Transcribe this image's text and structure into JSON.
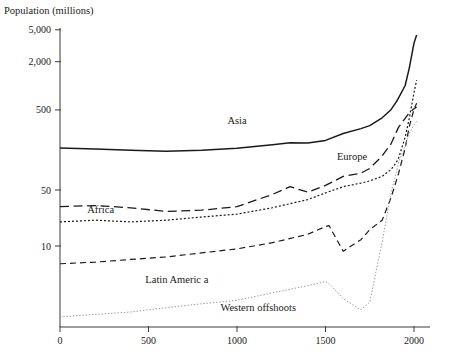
{
  "chart_data": {
    "type": "line",
    "title": "Population (millions)",
    "xlabel": "",
    "ylabel": "Population (millions)",
    "yscale": "log",
    "xlim": [
      0,
      2030
    ],
    "ylim": [
      1,
      7000
    ],
    "grid": false,
    "legend_position": "inline-labels",
    "xticks": [
      0,
      500,
      1000,
      1500,
      2000
    ],
    "xtick_labels": [
      "0",
      "500",
      "1000",
      "1500",
      "2000"
    ],
    "yticks": [
      10,
      50,
      500,
      2000,
      5000
    ],
    "ytick_labels": [
      "10",
      "50",
      "500",
      "2,000",
      "5,000"
    ],
    "series": [
      {
        "name": "Asia",
        "label": "Asia",
        "style": "solid",
        "label_x": 1000,
        "label_y": 330,
        "x": [
          0,
          200,
          400,
          600,
          800,
          1000,
          1200,
          1300,
          1400,
          1500,
          1600,
          1700,
          1750,
          1820,
          1870,
          1900,
          1913,
          1950,
          1973,
          2000,
          2015
        ],
        "y": [
          167,
          163,
          157,
          152,
          157,
          166,
          184,
          194,
          193,
          208,
          254,
          292,
          318,
          399,
          503,
          629,
          708,
          1008,
          1651,
          3410,
          4300
        ]
      },
      {
        "name": "Europe",
        "label": "Europe",
        "style": "long-dash",
        "label_x": 1650,
        "label_y": 120,
        "x": [
          0,
          200,
          400,
          600,
          800,
          1000,
          1200,
          1300,
          1400,
          1500,
          1600,
          1700,
          1750,
          1820,
          1870,
          1900,
          1913,
          1950,
          1973,
          2000,
          2015
        ],
        "y": [
          31,
          32,
          30,
          27,
          28,
          31,
          44,
          55,
          47,
          57,
          74,
          81,
          93,
          133,
          188,
          264,
          305,
          393,
          459,
          516,
          545
        ]
      },
      {
        "name": "Africa",
        "label": "Africa",
        "style": "dotted",
        "label_x": 230,
        "label_y": 26,
        "x": [
          0,
          200,
          400,
          600,
          800,
          1000,
          1200,
          1400,
          1500,
          1600,
          1700,
          1750,
          1820,
          1870,
          1900,
          1913,
          1950,
          1973,
          2000,
          2015
        ],
        "y": [
          20,
          21,
          20,
          21,
          23,
          25,
          30,
          38,
          46,
          55,
          61,
          65,
          74,
          90,
          110,
          125,
          228,
          390,
          820,
          1180
        ]
      },
      {
        "name": "Latin America",
        "label": "Latin Americ a",
        "style": "dash",
        "label_x": 660,
        "label_y": 3.5,
        "x": [
          0,
          200,
          400,
          600,
          800,
          1000,
          1200,
          1400,
          1500,
          1520,
          1600,
          1700,
          1750,
          1820,
          1870,
          1900,
          1913,
          1950,
          1973,
          2000,
          2015
        ],
        "y": [
          6,
          6.3,
          6.8,
          7.3,
          8.2,
          9.2,
          11,
          14,
          17.5,
          18,
          8.6,
          12,
          16,
          21,
          40,
          65,
          81,
          166,
          308,
          508,
          605
        ]
      },
      {
        "name": "Western offshoots",
        "label": "Western offshoots",
        "style": "fine-dotted",
        "label_x": 1120,
        "label_y": 1.55,
        "x": [
          0,
          200,
          400,
          600,
          800,
          1000,
          1200,
          1400,
          1500,
          1520,
          1600,
          1700,
          1750,
          1820,
          1870,
          1900,
          1913,
          1950,
          1973,
          2000,
          2015
        ],
        "y": [
          1.3,
          1.4,
          1.5,
          1.7,
          1.9,
          2.1,
          2.6,
          3.2,
          3.6,
          3.4,
          2.2,
          1.6,
          2.0,
          11.2,
          45.9,
          82,
          111,
          176,
          251,
          326,
          360
        ]
      }
    ]
  }
}
